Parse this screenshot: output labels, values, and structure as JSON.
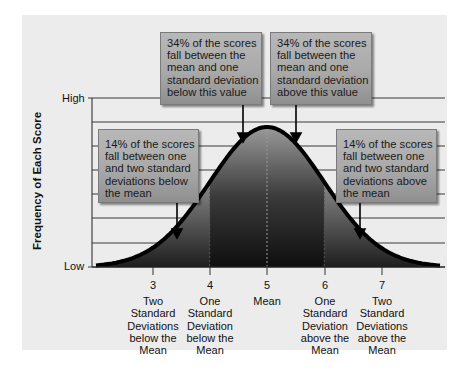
{
  "chart_data": {
    "type": "area",
    "title": "",
    "xlabel": "",
    "ylabel": "Frequency of Each Score",
    "y_ticks": [
      "Low",
      "High"
    ],
    "x_ticks": [
      {
        "value": 3,
        "label": "Two Standard Deviations below the Mean"
      },
      {
        "value": 4,
        "label": "One Standard Deviation below the Mean"
      },
      {
        "value": 5,
        "label": "Mean"
      },
      {
        "value": 6,
        "label": "One Standard Deviation above the Mean"
      },
      {
        "value": 7,
        "label": "Two Standard Deviations above the Mean"
      }
    ],
    "distribution": {
      "shape": "normal",
      "mean": 5,
      "sd": 1
    },
    "regions": [
      {
        "from": 3,
        "to": 4,
        "percent": 14
      },
      {
        "from": 4,
        "to": 5,
        "percent": 34
      },
      {
        "from": 5,
        "to": 6,
        "percent": 34
      },
      {
        "from": 6,
        "to": 7,
        "percent": 14
      }
    ],
    "grid": true,
    "annotations": [
      "34% of the scores fall between the mean and one standard deviation below this value",
      "34% of the scores fall between the mean and one standard deviation above this value",
      "14% of the scores fall between one and two standard deviations below the mean",
      "14% of the scores fall between one and two standard deviations above the mean"
    ]
  },
  "axis": {
    "y_title": "Frequency of Each Score",
    "y_high": "High",
    "y_low": "Low"
  },
  "x_labels": [
    {
      "num": "3",
      "lines": [
        "Two",
        "Standard",
        "Deviations",
        "below the",
        "Mean"
      ]
    },
    {
      "num": "4",
      "lines": [
        "One",
        "Standard",
        "Deviation",
        "below the",
        "Mean"
      ]
    },
    {
      "num": "5",
      "lines": [
        "Mean"
      ]
    },
    {
      "num": "6",
      "lines": [
        "One",
        "Standard",
        "Deviation",
        "above the",
        "Mean"
      ]
    },
    {
      "num": "7",
      "lines": [
        "Two",
        "Standard",
        "Deviations",
        "above the",
        "Mean"
      ]
    }
  ],
  "callouts": {
    "mid_left": [
      "34% of the scores",
      "fall between the",
      "mean and one",
      "standard deviation",
      "below this value"
    ],
    "mid_right": [
      "34% of the scores",
      "fall between the",
      "mean and one",
      "standard deviation",
      "above this value"
    ],
    "outer_left": [
      "14% of the scores",
      "fall between one",
      "and two standard",
      "deviations below",
      "the mean"
    ],
    "outer_right": [
      "14% of the scores",
      "fall between one",
      "and two standard",
      "deviations above",
      "the mean"
    ]
  },
  "colors": {
    "panel": "#ececec",
    "callout": "#a9a9a9",
    "curve": "#000000",
    "grid": "#333333"
  }
}
